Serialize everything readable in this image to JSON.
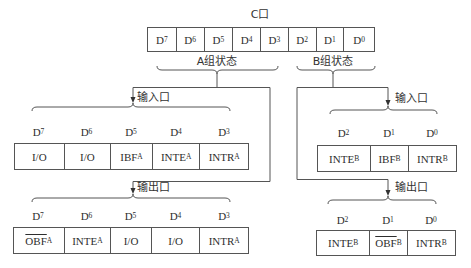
{
  "c_port": {
    "title": "C口",
    "bits": [
      {
        "main": "D",
        "sub": "7"
      },
      {
        "main": "D",
        "sub": "6"
      },
      {
        "main": "D",
        "sub": "5"
      },
      {
        "main": "D",
        "sub": "4"
      },
      {
        "main": "D",
        "sub": "3"
      },
      {
        "main": "D",
        "sub": "2"
      },
      {
        "main": "D",
        "sub": "1"
      },
      {
        "main": "D",
        "sub": "0"
      }
    ]
  },
  "group_a": {
    "label": "A组状态",
    "input": {
      "label": "输入口",
      "bits": [
        {
          "main": "D",
          "sub": "7"
        },
        {
          "main": "D",
          "sub": "6"
        },
        {
          "main": "D",
          "sub": "5"
        },
        {
          "main": "D",
          "sub": "4"
        },
        {
          "main": "D",
          "sub": "3"
        }
      ],
      "cells": [
        {
          "main": "I/O",
          "sub": ""
        },
        {
          "main": "I/O",
          "sub": ""
        },
        {
          "main": "IBF",
          "sub": "A"
        },
        {
          "main": "INTE",
          "sub": "A"
        },
        {
          "main": "INTR",
          "sub": "A"
        }
      ]
    },
    "output": {
      "label": "输出口",
      "bits": [
        {
          "main": "D",
          "sub": "7"
        },
        {
          "main": "D",
          "sub": "6"
        },
        {
          "main": "D",
          "sub": "5"
        },
        {
          "main": "D",
          "sub": "4"
        },
        {
          "main": "D",
          "sub": "3"
        }
      ],
      "cells": [
        {
          "main": "OBF",
          "sub": "A",
          "overline": true
        },
        {
          "main": "INTE",
          "sub": "A"
        },
        {
          "main": "I/O",
          "sub": ""
        },
        {
          "main": "I/O",
          "sub": ""
        },
        {
          "main": "INTR",
          "sub": "A"
        }
      ]
    }
  },
  "group_b": {
    "label": "B组状态",
    "input": {
      "label": "输入口",
      "bits": [
        {
          "main": "D",
          "sub": "2"
        },
        {
          "main": "D",
          "sub": "1"
        },
        {
          "main": "D",
          "sub": "0"
        }
      ],
      "cells": [
        {
          "main": "INTE",
          "sub": "B"
        },
        {
          "main": "IBF",
          "sub": "B"
        },
        {
          "main": "INTR",
          "sub": "B"
        }
      ]
    },
    "output": {
      "label": "输出口",
      "bits": [
        {
          "main": "D",
          "sub": "2"
        },
        {
          "main": "D",
          "sub": "1"
        },
        {
          "main": "D",
          "sub": "0"
        }
      ],
      "cells": [
        {
          "main": "INTE",
          "sub": "B"
        },
        {
          "main": "OBF",
          "sub": "B",
          "overline": true
        },
        {
          "main": "INTR",
          "sub": "B"
        }
      ]
    }
  },
  "colors": {
    "line": "#555555",
    "text": "#2e2e2e",
    "background": "#ffffff"
  }
}
